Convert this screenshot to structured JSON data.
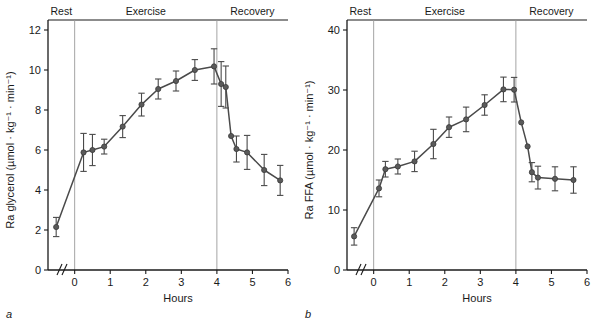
{
  "figure": {
    "caption_letters": {
      "a": "a",
      "b": "b"
    },
    "phase_labels": [
      "Rest",
      "Exercise",
      "Recovery"
    ],
    "xlabel": "Hours",
    "line_color": "#4a4a4a",
    "marker_color": "#5a5a5a",
    "divider_color": "#9a9a9a"
  },
  "chart_data": [
    {
      "type": "line",
      "panel": "a",
      "title": "",
      "xlabel": "Hours",
      "ylabel": "Ra glycerol (µmol · kg⁻¹ · min⁻¹)",
      "xlim": [
        -0.75,
        6
      ],
      "ylim": [
        0,
        12
      ],
      "xticks": [
        0,
        1,
        2,
        3,
        4,
        5,
        6
      ],
      "xtick_labels": [
        "0",
        "1",
        "2",
        "3",
        "4",
        "5",
        "6"
      ],
      "yticks": [
        0,
        2,
        4,
        6,
        8,
        10,
        12
      ],
      "ytick_labels": [
        "0",
        "2",
        "4",
        "6",
        "8",
        "10",
        "12"
      ],
      "grid": false,
      "axis_break": true,
      "phase_boundaries": [
        0,
        4
      ],
      "phases": [
        {
          "label": "Rest",
          "from": -0.75,
          "to": 0
        },
        {
          "label": "Exercise",
          "from": 0,
          "to": 4
        },
        {
          "label": "Recovery",
          "from": 4,
          "to": 6
        }
      ],
      "series": [
        {
          "name": "Ra glycerol",
          "x": [
            -0.52,
            0.25,
            0.5,
            0.83,
            1.35,
            1.88,
            2.35,
            2.85,
            3.38,
            3.92,
            4.12,
            4.25,
            4.4,
            4.55,
            4.85,
            5.33,
            5.78
          ],
          "y": [
            2.15,
            5.88,
            6.0,
            6.17,
            7.17,
            8.27,
            9.05,
            9.45,
            10.0,
            10.18,
            9.3,
            9.15,
            6.7,
            6.05,
            5.88,
            5.0,
            4.48
          ],
          "yerr": [
            0.48,
            0.95,
            0.78,
            0.37,
            0.55,
            0.57,
            0.5,
            0.5,
            0.52,
            0.88,
            1.12,
            1.05,
            0.0,
            0.65,
            0.85,
            0.78,
            0.75
          ]
        }
      ]
    },
    {
      "type": "line",
      "panel": "b",
      "title": "",
      "xlabel": "Hours",
      "ylabel": "Ra FFA (µmol · kg⁻¹ · min⁻¹)",
      "xlim": [
        -0.75,
        6
      ],
      "ylim": [
        0,
        40
      ],
      "xticks": [
        0,
        1,
        2,
        3,
        4,
        5,
        6
      ],
      "xtick_labels": [
        "0",
        "1",
        "2",
        "3",
        "4",
        "5",
        "6"
      ],
      "yticks": [
        0,
        10,
        20,
        30,
        40
      ],
      "ytick_labels": [
        "0",
        "10",
        "20",
        "30",
        "40"
      ],
      "grid": false,
      "axis_break": true,
      "phase_boundaries": [
        0,
        4
      ],
      "phases": [
        {
          "label": "Rest",
          "from": -0.75,
          "to": 0
        },
        {
          "label": "Exercise",
          "from": 0,
          "to": 4
        },
        {
          "label": "Recovery",
          "from": 4,
          "to": 6
        }
      ],
      "series": [
        {
          "name": "Ra FFA",
          "x": [
            -0.55,
            0.15,
            0.33,
            0.68,
            1.15,
            1.68,
            2.12,
            2.6,
            3.12,
            3.65,
            3.95,
            4.15,
            4.33,
            4.45,
            4.62,
            5.1,
            5.62
          ],
          "y": [
            5.6,
            13.6,
            16.8,
            17.25,
            18.1,
            21.0,
            23.8,
            25.1,
            27.5,
            30.1,
            30.05,
            24.6,
            20.6,
            16.3,
            15.4,
            15.2,
            15.0
          ],
          "yerr": [
            1.45,
            1.4,
            1.3,
            1.25,
            1.7,
            2.45,
            1.7,
            2.05,
            1.7,
            2.05,
            2.05,
            0.0,
            0.0,
            1.6,
            1.9,
            2.0,
            2.2
          ]
        }
      ]
    }
  ]
}
